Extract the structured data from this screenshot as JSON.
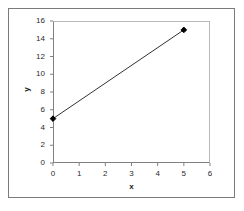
{
  "chart_data": {
    "type": "line",
    "title": "",
    "xlabel": "x",
    "ylabel": "y",
    "x": [
      0,
      5
    ],
    "values": [
      5,
      15
    ],
    "series": [
      {
        "name": "Series 1",
        "x": [
          0,
          5
        ],
        "values": [
          5,
          15
        ],
        "marker": "diamond",
        "color": "#000000"
      }
    ],
    "xlim": [
      0,
      6
    ],
    "ylim": [
      0,
      16
    ],
    "xticks": [
      0,
      1,
      2,
      3,
      4,
      5,
      6
    ],
    "yticks": [
      0,
      2,
      4,
      6,
      8,
      10,
      12,
      14,
      16
    ],
    "xtick_labels": [
      "0",
      "1",
      "2",
      "3",
      "4",
      "5",
      "6"
    ],
    "ytick_labels": [
      "0",
      "2",
      "4",
      "6",
      "8",
      "10",
      "12",
      "14",
      "16"
    ],
    "grid": false,
    "legend": false,
    "legend_position": "none",
    "line_color": "#333333",
    "marker_color": "#000000",
    "axis_color": "#808080",
    "plot_background": "#ffffff",
    "frame_border_color": "#7b7b7b"
  }
}
